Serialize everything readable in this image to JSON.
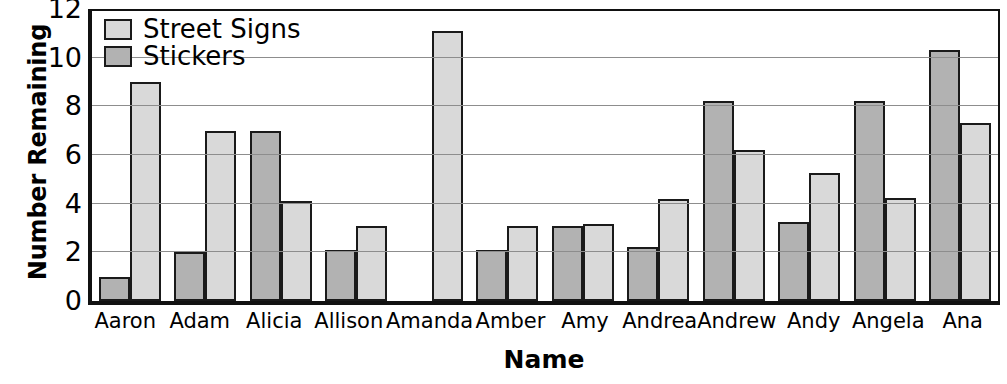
{
  "chart_data": {
    "type": "bar",
    "title": "",
    "xlabel": "Name",
    "ylabel": "Number Remaining",
    "categories": [
      "Aaron",
      "Adam",
      "Alicia",
      "Allison",
      "Amanda",
      "Amber",
      "Amy",
      "Andrea",
      "Andrew",
      "Andy",
      "Angela",
      "Ana"
    ],
    "series": [
      {
        "name": "Stickers",
        "color": "#b2b2b2",
        "values": [
          1.0,
          2.0,
          7.0,
          2.1,
          0,
          2.1,
          3.1,
          2.2,
          8.2,
          3.25,
          8.2,
          10.3
        ]
      },
      {
        "name": "Street Signs",
        "color": "#d9d9d9",
        "values": [
          9.0,
          7.0,
          4.1,
          3.1,
          11.1,
          3.1,
          3.15,
          4.2,
          6.2,
          5.25,
          4.25,
          7.3
        ]
      }
    ],
    "ylim": [
      0,
      12
    ],
    "yticks": [
      "12",
      "10",
      "8",
      "6",
      "4",
      "2",
      "0"
    ],
    "grid": true,
    "legend_position": "top-left",
    "bar_order_in_group": [
      "Stickers",
      "Street Signs"
    ]
  },
  "legend": {
    "entries": [
      {
        "label": "Street Signs",
        "swatch": "signs"
      },
      {
        "label": "Stickers",
        "swatch": "stickers"
      }
    ]
  },
  "axes": {
    "y_title": "Number Remaining",
    "x_title": "Name"
  }
}
